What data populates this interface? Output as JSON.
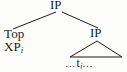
{
  "diagram": {
    "kind": "syntax-tree",
    "background_color": "#fdfdfb",
    "line_color": "#1b1b1b",
    "text_color": "#1b1b1b",
    "nodes": {
      "root": {
        "label": "IP",
        "role": "root-inflectional-phrase"
      },
      "left_specifier": {
        "line1": "Top",
        "line2_base": "XP",
        "line2_subscript": "i",
        "role": "topicalized-specifier"
      },
      "right_child": {
        "label": "IP",
        "role": "embedded-inflectional-phrase"
      },
      "terminal": {
        "ellipsis_left": "…",
        "trace_base": "t",
        "trace_subscript": "i",
        "ellipsis_right": "…",
        "role": "trace-terminal-string"
      }
    },
    "edges": [
      {
        "name": "root-to-left-specifier",
        "from": "root",
        "to": "left_specifier"
      },
      {
        "name": "root-to-right-ip",
        "from": "root",
        "to": "right_child"
      },
      {
        "name": "right-ip-triangle",
        "from": "right_child",
        "to": "terminal",
        "style": "triangle"
      }
    ]
  }
}
